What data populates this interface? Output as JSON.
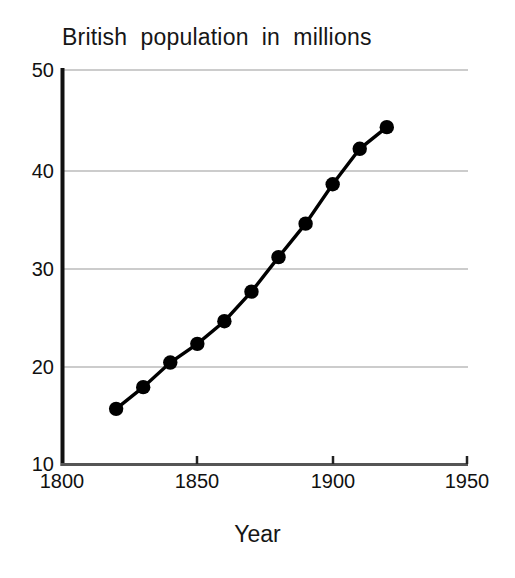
{
  "chart_data": {
    "type": "line",
    "title": "British  population  in  millions",
    "xlabel": "Year",
    "ylabel": "",
    "x": [
      1820,
      1830,
      1840,
      1850,
      1860,
      1870,
      1880,
      1890,
      1900,
      1910,
      1920
    ],
    "values": [
      15.6,
      17.8,
      20.3,
      22.2,
      24.5,
      27.5,
      31.0,
      34.4,
      38.4,
      42.0,
      44.2
    ],
    "series": [
      {
        "name": "British population",
        "values": [
          15.6,
          17.8,
          20.3,
          22.2,
          24.5,
          27.5,
          31.0,
          34.4,
          38.4,
          42.0,
          44.2
        ]
      }
    ],
    "xlim": [
      1800,
      1950
    ],
    "ylim": [
      10,
      50
    ],
    "xticks": [
      1800,
      1850,
      1900,
      1950
    ],
    "yticks": [
      10,
      20,
      30,
      40,
      50
    ],
    "xtick_labels": [
      "1800",
      "1850",
      "1900",
      "1950"
    ],
    "ytick_labels": [
      "10",
      "20",
      "30",
      "40",
      "50"
    ],
    "grid": "horizontal",
    "legend": "none",
    "marker": "filled-circle",
    "marker_color": "#000000",
    "line_color": "#000000",
    "grid_color": "#9a9a9a",
    "axis_color": "#111111"
  },
  "axes": {
    "y_labels": [
      "50",
      "40",
      "30",
      "20",
      "10"
    ],
    "x_labels": [
      "1800",
      "1850",
      "1900",
      "1950"
    ],
    "x_title": "Year"
  },
  "title": "British  population  in  millions"
}
